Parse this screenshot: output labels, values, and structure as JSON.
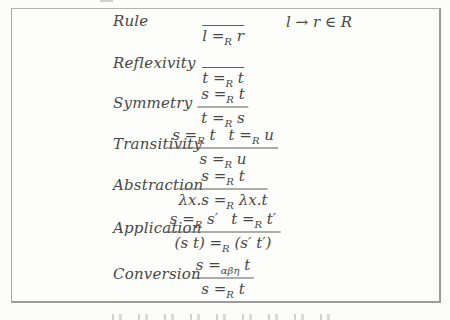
{
  "figure": {
    "kind": "inference-rules-figure",
    "rows": [
      {
        "label": "Rule",
        "num": [],
        "den": [
          {
            "pre": "l =",
            "sub": "R",
            "post": " r"
          }
        ],
        "side": "l → r ∈ R"
      },
      {
        "label": "Reflexivity",
        "num": [],
        "den": [
          {
            "pre": "t =",
            "sub": "R",
            "post": " t"
          }
        ]
      },
      {
        "label": "Symmetry",
        "num": [
          {
            "pre": "s =",
            "sub": "R",
            "post": " t"
          }
        ],
        "den": [
          {
            "pre": "t =",
            "sub": "R",
            "post": " s"
          }
        ]
      },
      {
        "label": "Transitivity",
        "num": [
          {
            "pre": "s =",
            "sub": "R",
            "post": " t"
          },
          {
            "pre": "t =",
            "sub": "R",
            "post": " u"
          }
        ],
        "den": [
          {
            "pre": "s =",
            "sub": "R",
            "post": " u"
          }
        ]
      },
      {
        "label": "Abstraction",
        "num": [
          {
            "pre": "s =",
            "sub": "R",
            "post": " t"
          }
        ],
        "den": [
          {
            "pre": "λx.s =",
            "sub": "R",
            "post": " λx.t"
          }
        ]
      },
      {
        "label": "Application",
        "num": [
          {
            "pre": "s =",
            "sub": "R",
            "post": " s′"
          },
          {
            "pre": "t =",
            "sub": "R",
            "post": " t′"
          }
        ],
        "den": [
          {
            "pre": "(s t) =",
            "sub": "R",
            "post": " (s′ t′)"
          }
        ]
      },
      {
        "label": "Conversion",
        "num": [
          {
            "pre": "s =",
            "sub": "αβη",
            "post": " t"
          }
        ],
        "den": [
          {
            "pre": "s =",
            "sub": "R",
            "post": " t"
          }
        ]
      }
    ],
    "colors": {
      "text": "#474745",
      "fraction_bar": "#5e5e5c",
      "box_border": "#9b9b99",
      "background": "#fcfcfb"
    }
  }
}
